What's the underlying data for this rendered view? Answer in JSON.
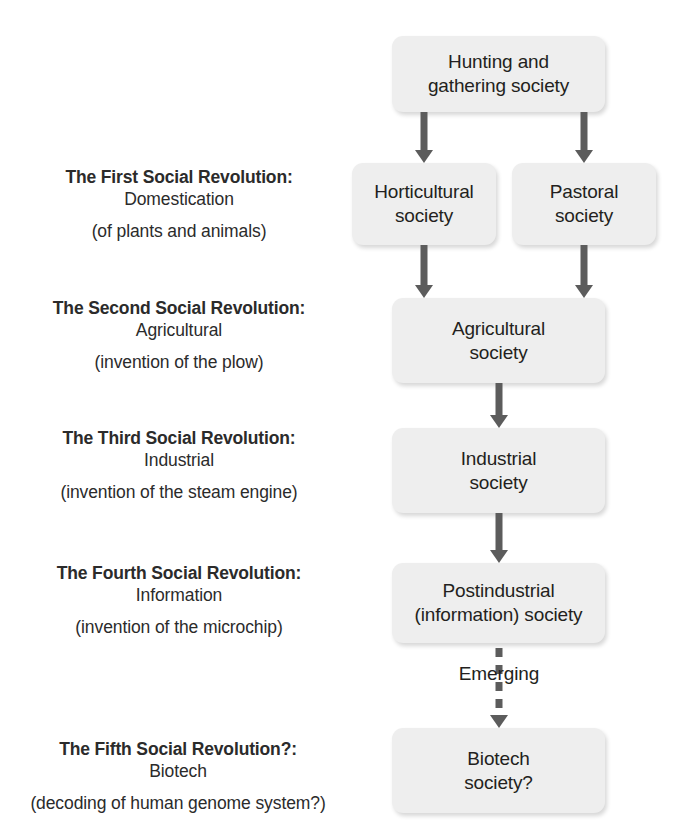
{
  "diagram": {
    "type": "flowchart",
    "colors": {
      "node_fill": "#eeeeee",
      "node_text": "#231f20",
      "arrow": "#5c5c5c",
      "label_text": "#2b2b2b",
      "background": "#ffffff"
    },
    "revolutions": [
      {
        "title": "The First Social Revolution:",
        "subtitle": "Domestication",
        "note": "(of plants and animals)"
      },
      {
        "title": "The Second Social Revolution:",
        "subtitle": "Agricultural",
        "note": "(invention of the plow)"
      },
      {
        "title": "The Third Social Revolution:",
        "subtitle": "Industrial",
        "note": "(invention of the steam engine)"
      },
      {
        "title": "The Fourth Social Revolution:",
        "subtitle": "Information",
        "note": "(invention of the microchip)"
      },
      {
        "title": "The Fifth Social Revolution?:",
        "subtitle": "Biotech",
        "note": "(decoding of human genome system?)"
      }
    ],
    "nodes": [
      {
        "id": "hunting",
        "label": "Hunting and\ngathering society"
      },
      {
        "id": "horticultural",
        "label": "Horticultural\nsociety"
      },
      {
        "id": "pastoral",
        "label": "Pastoral\nsociety"
      },
      {
        "id": "agricultural",
        "label": "Agricultural\nsociety"
      },
      {
        "id": "industrial",
        "label": "Industrial\nsociety"
      },
      {
        "id": "postindustrial",
        "label": "Postindustrial\n(information) society"
      },
      {
        "id": "biotech",
        "label": "Biotech\nsociety?"
      }
    ],
    "edge_labels": {
      "emerging": "Emerging"
    }
  }
}
